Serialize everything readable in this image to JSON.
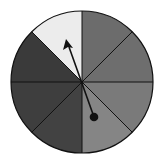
{
  "spinner": {
    "sector_count": 8,
    "sectors": [
      {
        "id": "n-ne",
        "color": "#6c6c6c"
      },
      {
        "id": "ne-e",
        "color": "#6e6e6e"
      },
      {
        "id": "e-se",
        "color": "#7a7a7a"
      },
      {
        "id": "se-s",
        "color": "#858585"
      },
      {
        "id": "s-sw",
        "color": "#424242"
      },
      {
        "id": "sw-w",
        "color": "#3e3e3e"
      },
      {
        "id": "w-nw",
        "color": "#3a3a3a"
      },
      {
        "id": "nw-n",
        "color": "#ececec"
      }
    ],
    "outline_color": "#111111",
    "pointer": {
      "color": "#111111",
      "points_to_sector": "nw-n"
    }
  }
}
